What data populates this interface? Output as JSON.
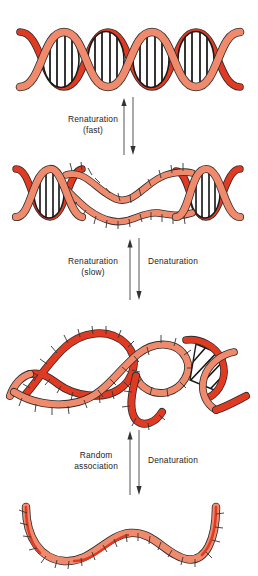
{
  "figure": {
    "background_color": "#ffffff",
    "palette": {
      "strand_light": "#F08A6C",
      "strand_dark": "#E03A23",
      "strand_mid": "#E8603F",
      "outline": "#2b2b2b",
      "basepair": "#111111",
      "text": "#1d1d1d",
      "arrow": "#555555"
    }
  },
  "states": [
    {
      "id": "native-duplex",
      "name": "native-double-helix",
      "description": "Intact DNA double helix with four base-paired regions",
      "basepair_regions": 4,
      "top": 22
    },
    {
      "id": "partially-denatured",
      "name": "partially-denatured-duplex",
      "description": "Duplex with a central denaturation bubble of unpaired bases flanked by two base-paired helical regions",
      "basepair_regions": 2,
      "top": 155
    },
    {
      "id": "random-coil",
      "name": "separated-random-coils",
      "description": "Fully separated strands forming random coils with one small residual base-paired duplex region",
      "basepair_regions": 1,
      "top": 300
    },
    {
      "id": "single-strand",
      "name": "single-stranded-dna",
      "description": "A single separated DNA strand with exposed bases",
      "basepair_regions": 0,
      "top": 495
    }
  ],
  "arrows": [
    {
      "id": "arrow-top",
      "top": 97,
      "height": 58,
      "up_label": "Renaturation",
      "up_label_sub": "(fast)",
      "down_label": "",
      "down_label_sub": ""
    },
    {
      "id": "arrow-middle",
      "top": 238,
      "height": 62,
      "up_label": "Renaturation",
      "up_label_sub": "(slow)",
      "down_label": "Denaturation",
      "down_label_sub": ""
    },
    {
      "id": "arrow-bottom",
      "top": 430,
      "height": 65,
      "up_label": "Random",
      "up_label_sub": "association",
      "down_label": "Denaturation",
      "down_label_sub": ""
    }
  ]
}
